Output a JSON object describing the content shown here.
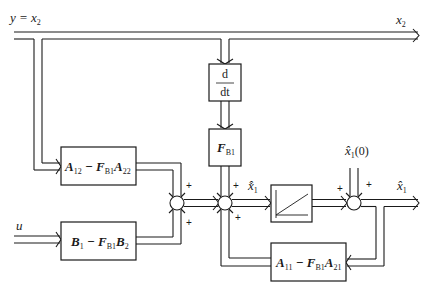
{
  "diagram": {
    "type": "reduced-order observer block diagram",
    "inputs": {
      "y_label": "y = x",
      "y_sub": "2",
      "u_label": "u"
    },
    "outputs": {
      "x2_label": "x",
      "x2_sub": "2",
      "x1hat_label": "x̂",
      "x1hat_sub": "1"
    },
    "blocks": {
      "derivative": {
        "num": "d",
        "den": "dt"
      },
      "fb1": {
        "main": "F",
        "sub": "B1"
      },
      "a12": {
        "p1": "A",
        "s1": "12",
        "p2": " − F",
        "s2": "B1",
        "p3": "A",
        "s3": "22"
      },
      "b1": {
        "p1": "B",
        "s1": "1",
        "p2": " − F",
        "s2": "B1",
        "p3": "B",
        "s3": "2"
      },
      "a11": {
        "p1": "A",
        "s1": "11",
        "p2": " − F",
        "s2": "B1",
        "p3": "A",
        "s3": "21"
      },
      "integrator": {
        "name": "integrator"
      }
    },
    "signals": {
      "x1hat_dot_label": "x̂̇",
      "x1hat_dot_sub": "1",
      "initial_label": "x̂",
      "initial_sub": "1",
      "initial_arg": "(0)"
    },
    "signs": {
      "sum1_top": "+",
      "sum1_bottom": "+",
      "sum2_top": "+",
      "sum2_bottom": "+",
      "sum3_left": "+",
      "sum3_top": "+"
    }
  }
}
